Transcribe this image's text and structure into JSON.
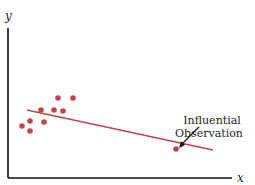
{
  "chart_data": {
    "type": "scatter",
    "title": "",
    "xlabel": "x",
    "ylabel": "y",
    "grid": false,
    "colors": {
      "points": "#c0454a",
      "line": "#c0454a",
      "axes": "#111111"
    },
    "points": [
      {
        "x": 22,
        "y": 126
      },
      {
        "x": 30,
        "y": 121
      },
      {
        "x": 30,
        "y": 131
      },
      {
        "x": 44,
        "y": 122
      },
      {
        "x": 41,
        "y": 110
      },
      {
        "x": 54,
        "y": 110
      },
      {
        "x": 63,
        "y": 111
      },
      {
        "x": 58,
        "y": 98
      },
      {
        "x": 73,
        "y": 98
      }
    ],
    "influential_point": {
      "x": 176,
      "y": 149
    },
    "regression_line": {
      "x1": 27,
      "y1": 110,
      "x2": 213,
      "y2": 150
    },
    "annotation": {
      "line1": "Influential",
      "line2": "Observation"
    }
  }
}
